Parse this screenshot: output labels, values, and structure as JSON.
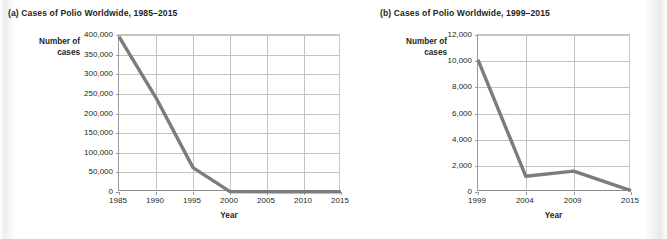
{
  "figure": {
    "panel_a_title": "(a) Cases of Polio Worldwide, 1985–2015",
    "panel_b_title": "(b) Cases of Polio Worldwide, 1999–2015",
    "line_color": "#7c7c7c",
    "grid_color": "#c2c2c2",
    "axis_color": "#8d8d8d",
    "text_color": "#231f20"
  },
  "chart_data": [
    {
      "type": "line",
      "title": "(a) Cases of Polio Worldwide, 1985–2015",
      "xlabel": "Year",
      "ylabel": "Number of cases",
      "ylabel_line1": "Number of",
      "ylabel_line2": "cases",
      "x": [
        1985,
        1990,
        1995,
        2000,
        2005,
        2010,
        2015
      ],
      "values": [
        396000,
        240000,
        62000,
        1000,
        500,
        500,
        300
      ],
      "xticks": [
        "1985",
        "1990",
        "1995",
        "2000",
        "2005",
        "2010",
        "2015"
      ],
      "yticks": [
        "0",
        "50,000",
        "100,000",
        "150,000",
        "200,000",
        "250,000",
        "300,000",
        "350,000",
        "400,000"
      ],
      "ytick_values": [
        0,
        50000,
        100000,
        150000,
        200000,
        250000,
        300000,
        350000,
        400000
      ],
      "xlim": [
        1985,
        2015
      ],
      "ylim": [
        0,
        400000
      ],
      "grid": true,
      "legend": "none"
    },
    {
      "type": "line",
      "title": "(b) Cases of Polio Worldwide, 1999–2015",
      "xlabel": "Year",
      "ylabel": "Number of cases",
      "ylabel_line1": "Number of",
      "ylabel_line2": "cases",
      "x": [
        1999,
        2004,
        2009,
        2015
      ],
      "values": [
        10100,
        1200,
        1600,
        100
      ],
      "xticks": [
        "1999",
        "2004",
        "2009",
        "2015"
      ],
      "yticks": [
        "0",
        "2,000",
        "4,000",
        "6,000",
        "8,000",
        "10,000",
        "12,000"
      ],
      "ytick_values": [
        0,
        2000,
        4000,
        6000,
        8000,
        10000,
        12000
      ],
      "xlim": [
        1999,
        2015
      ],
      "ylim": [
        0,
        12000
      ],
      "grid": true,
      "legend": "none"
    }
  ]
}
